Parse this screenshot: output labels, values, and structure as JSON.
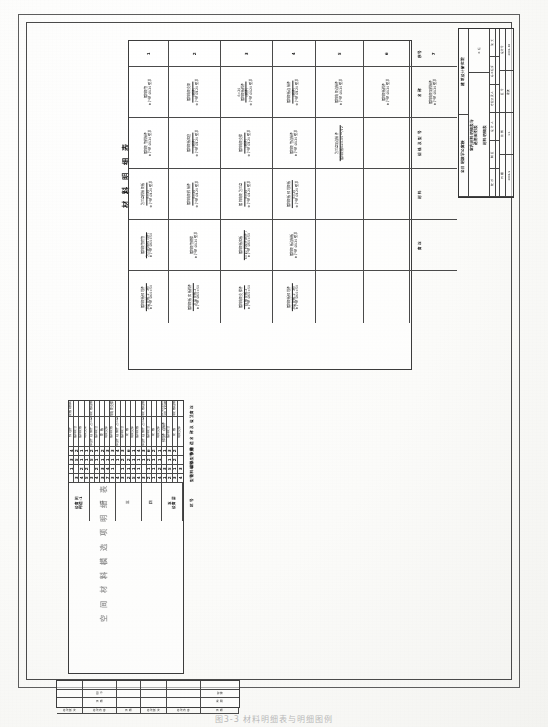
{
  "sheet": {
    "orientation": "landscape-rotated-90",
    "caption": "图3-3  材料明细表与明细图例"
  },
  "material_table": {
    "title": "材 料 明 细 表",
    "col_headers": [
      "序号",
      "名  称",
      "规 格 及 型 号",
      "材  料",
      "备  注"
    ],
    "row_numbers": [
      "1",
      "2",
      "3",
      "4",
      "5",
      "6",
      "7"
    ],
    "rows": [
      {
        "no": "1",
        "cells": [
          {
            "label": "镀锌钢管",
            "note": "Φ 外径 Ø120 壁厚",
            "frac_top": "",
            "frac_bot": ""
          },
          {
            "label": "镀锌钢管焊接件",
            "note": "Φ 外径 Ø120 壁厚",
            "frac_top": "",
            "frac_bot": ""
          },
          {
            "label": "法兰盘焊接钢板",
            "note": "Φ 外径 Ø120 壁厚",
            "sub": "δ=20"
          },
          {
            "label": "镀锌钢管套管",
            "sub": "法兰(焊接预埋件)",
            "note": "Φ 外径 Ø60×50"
          },
          {
            "label": "镀锌钢板预埋件",
            "sub": "厚度  钢板-2（附）",
            "note": "Φ 外径 Ø60×50"
          }
        ]
      },
      {
        "no": "2",
        "cells": [
          {
            "label": "镀锌角钢支架",
            "sub": "(附件)",
            "note": "Φ 外径 Ø120 壁厚"
          },
          {
            "label": "镀锌钢板底座",
            "sub": "(附件)",
            "note": "Φ 外径 Ø120 壁厚"
          },
          {
            "label": "镀锌角钢焊接件",
            "sub": "δ=20",
            "note": "Φ 外径 Ø120 壁厚"
          },
          {
            "label": "镀锌钢管横撑",
            "note": "Φ 外径 Ø120 壁厚"
          },
          {
            "label": "镀锌钢板  底板焊件",
            "sub": "厚度  钢板-2",
            "note": "Φ 外径 Ø60×50"
          }
        ]
      },
      {
        "no": "3",
        "cells": [
          {
            "label": "镀锌钢板焊件",
            "sub": "(附件)",
            "note": "Φ 外径 Ø120 壁厚",
            "extra": "δ=20"
          },
          {
            "label": "镀锌角钢支撑",
            "sub": "(附件)",
            "note": "Φ 外径 Ø120 壁厚"
          },
          {
            "label": "镀锌角钢  法兰盘",
            "sub": "δ=20",
            "note": "Φ 外径 Ø120 壁厚"
          },
          {
            "label": "镀锌钢板底板",
            "sub": "δ=10  焊缝件(附件)",
            "note": "Φ 外径 Ø60×50"
          },
          {
            "label": "镀锌角钢支撑件",
            "sub": "连接  钢板-2",
            "note": "Φ 外径 Ø60×50"
          }
        ]
      },
      {
        "no": "4",
        "cells": [
          {
            "label": "镀锌钢板连接件",
            "sub": "(附件)",
            "note": "Φ 外径 Ø120 壁厚"
          },
          {
            "label": "镀锌钢管连接件",
            "note": "Φ 外径 Ø120 壁厚"
          },
          {
            "label": "镀锌钢板  预埋钢板",
            "sub": "δ=20",
            "note": "Φ 外径 Ø120 壁厚"
          },
          {
            "label": "镀锌钢板连接板",
            "note": "Φ 外径 Ø120 壁厚"
          },
          {
            "label": "镀锌钢板预埋件",
            "sub": "厚度  钢板-2（附）",
            "note": "Φ 外径 Ø60×50"
          }
        ]
      },
      {
        "no": "5",
        "cells": [
          {
            "label": "镀锌角钢连接件",
            "note": "Φ 外径 Ø120 壁厚"
          },
          {
            "label": "法兰盘及连接件",
            "sub": "镀锌钢板δ≥0.05 ～/72"
          },
          {
            "label": "",
            "note": ""
          },
          {
            "label": "",
            "note": ""
          },
          {
            "label": "",
            "note": ""
          }
        ]
      },
      {
        "no": "6",
        "cells": [
          {
            "label": "镀锌钢板焊件",
            "note": "Φ 外径 Ø120 壁厚"
          },
          {
            "label": "",
            "note": ""
          },
          {
            "label": "",
            "note": ""
          },
          {
            "label": "",
            "note": ""
          },
          {
            "label": "",
            "note": ""
          }
        ]
      },
      {
        "no": "7",
        "cells": [
          {
            "label": "镀锌角钢及焊接件",
            "note": "Φ 外径 Ø120 壁厚"
          },
          {
            "label": "",
            "note": ""
          },
          {
            "label": "",
            "note": ""
          },
          {
            "label": "",
            "note": ""
          },
          {
            "label": "",
            "note": ""
          }
        ]
      }
    ]
  },
  "selection_table": {
    "title": "空 间 材 料 模 选 项 明 细 表",
    "col_headers": [
      "区  号",
      "构  造  名  称  及  做  法",
      "数量",
      "规格型号",
      "材料编号",
      "型号",
      "备                注"
    ],
    "groups": [
      {
        "zone": "设备间\n构造-1",
        "rows": [
          {
            "name": "预埋件",
            "c1": "4",
            "c2": "3",
            "c3": "1",
            "c4": "",
            "note": "预埋钢板规格δ/51"
          },
          {
            "name": "镀锌钢管",
            "c1": "2",
            "c2": "5",
            "c3": "",
            "c4": "3",
            "note": ""
          },
          {
            "name": "镀锌钢板",
            "c1": "1",
            "c2": "1",
            "c3": "2",
            "c4": "4",
            "note": ""
          },
          {
            "name": "角钢支架",
            "c1": "1",
            "c2": "1",
            "c3": "2",
            "c4": "5",
            "note": ""
          }
        ]
      },
      {
        "zone": "二",
        "rows": [
          {
            "name": "预埋件  连接件  法兰盘",
            "c1": "2",
            "c2": "5",
            "c3": "",
            "c4": "3",
            "note": "镀锌钢板连接件"
          },
          {
            "name": "镀锌钢管",
            "c1": "1",
            "c2": "1",
            "c3": "2",
            "c4": "4",
            "note": ""
          },
          {
            "name": "钢  板",
            "c1": "2",
            "c2": "1",
            "c3": "3",
            "c4": "3",
            "note": ""
          },
          {
            "name": "角钢支撑",
            "c1": "3",
            "c2": "1",
            "c3": "4",
            "c4": "7",
            "note": ""
          },
          {
            "name": "镀锌钢板",
            "c1": "3",
            "c2": "1",
            "c3": "1",
            "c4": "3",
            "note": "镀锌角钢支撑件"
          }
        ]
      },
      {
        "zone": "三",
        "rows": [
          {
            "name": "预埋件  连接件  法兰盘",
            "c1": "4",
            "c2": "1",
            "c3": "",
            "c4": "4",
            "note": ""
          },
          {
            "name": "镀锌钢管",
            "c1": "3",
            "c2": "2",
            "c3": "1",
            "c4": "3",
            "note": ""
          },
          {
            "name": "钢  板",
            "c1": "6",
            "c2": "2",
            "c3": "1",
            "c4": "2",
            "note": ""
          },
          {
            "name": "角钢支撑",
            "c1": "1",
            "c2": "1",
            "c3": "1",
            "c4": "5",
            "note": ""
          },
          {
            "name": "镀锌钢板",
            "c1": "4",
            "c2": "1",
            "c3": "1",
            "c4": "4",
            "note": ""
          }
        ]
      },
      {
        "zone": "四",
        "rows": [
          {
            "name": "预埋件  连接件  法兰盘",
            "c1": "3",
            "c2": "1",
            "c3": "",
            "c4": "3",
            "note": "镀锌钢板连接件"
          },
          {
            "name": "镀锌钢管",
            "c1": "6",
            "c2": "2",
            "c3": "1",
            "c4": "2",
            "note": ""
          },
          {
            "name": "钢  板",
            "c1": "2",
            "c2": "1",
            "c3": "1",
            "c4": "1",
            "note": ""
          },
          {
            "name": "角钢支撑",
            "c1": "1",
            "c2": "1",
            "c3": "2",
            "c4": "4",
            "note": ""
          }
        ]
      },
      {
        "zone": "五\n设备层",
        "rows": [
          {
            "name": "预埋件  连接件",
            "c1": "1",
            "c2": "",
            "c3": "3",
            "c4": "1",
            "note": "镀锌角钢及连接件安装\n详见大样图"
          },
          {
            "name": "镀锌钢管",
            "c1": "3",
            "c2": "1",
            "c3": "5",
            "c4": "2",
            "note": ""
          },
          {
            "name": "钢  板",
            "c1": "2",
            "c2": "2",
            "c3": "1",
            "c4": "3",
            "note": "镀锌钢板连接件"
          },
          {
            "name": "角钢支撑",
            "c1": "",
            "c2": "",
            "c3": "3",
            "c4": "4",
            "note": ""
          }
        ]
      }
    ]
  },
  "title_block": {
    "design_institute": "建筑设计研究院",
    "project_name": "全日制教学公寓楼",
    "drawing_name": "室内材料明细表与\n选用图例表",
    "subtitle": "材料明细表",
    "stage_label": "工 程",
    "role_labels": [
      "院  长",
      "总工程师",
      "专业负责人",
      "设  计  人",
      "制  图",
      "校  对"
    ],
    "spec_labels": [
      "设计号",
      "图  号",
      "比  例",
      "日  期"
    ],
    "spec_values": [
      "2002-08",
      "建施",
      "1:1",
      "2006.9"
    ],
    "sig_label": "签  名"
  },
  "revision_block": {
    "headers": [
      "修改版次",
      "修改内容",
      "日  期",
      "修改版次",
      "修改内容",
      "日  期"
    ],
    "rows": [
      {
        "cols": [
          "",
          "",
          "",
          "",
          "",
          ""
        ]
      },
      {
        "cols": [
          "",
          "图  号",
          "",
          "",
          "",
          "建施"
        ]
      },
      {
        "cols": [
          "",
          "日  期",
          "",
          "",
          "",
          "说  明"
        ]
      }
    ]
  }
}
